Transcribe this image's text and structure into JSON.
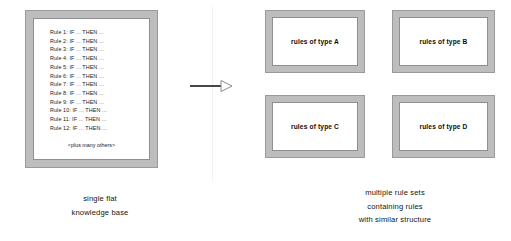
{
  "diagram": {
    "knowledge_base": {
      "name": "single flat knowledge base",
      "rules": [
        "Rule 1: IF ... THEN ...",
        "Rule 2: IF ... THEN ...",
        "Rule 3: IF ... THEN ...",
        "Rule 4: IF ... THEN ...",
        "Rule 5: IF ... THEN ...",
        "Rule 6: IF ... THEN ...",
        "Rule 7: IF ... THEN ...",
        "Rule 8: IF ... THEN ...",
        "Rule 9: IF ... THEN ...",
        "Rule 10: IF ... THEN ...",
        "Rule 11: IF ... THEN ...",
        "Rule 12: IF ... THEN ..."
      ],
      "more_text": "<plus many others>"
    },
    "arrow": {
      "name": "transformation-arrow",
      "direction": "right",
      "head_style": "hollow-triangle",
      "line_color": "#1a1a1a",
      "head_fill": "#ffffff",
      "head_stroke": "#8a8a8a"
    },
    "rule_sets": [
      {
        "label": "rules of type A"
      },
      {
        "label": "rules of type B"
      },
      {
        "label": "rules of type C"
      },
      {
        "label": "rules of type D"
      }
    ],
    "captions": {
      "left": [
        "single flat",
        "knowledge base"
      ],
      "right": [
        "multiple rule sets",
        "containing rules",
        "with similar structure"
      ]
    },
    "colors": {
      "frame_fill": "#bdbdbd",
      "frame_outline": "#9a9a9a",
      "interior": "#ffffff",
      "text": "#141414",
      "divider": "#f2f2f2"
    }
  }
}
